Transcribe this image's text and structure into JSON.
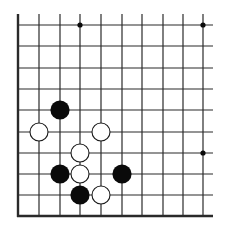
{
  "board": {
    "type": "go-diagram",
    "visible_columns": 10,
    "visible_rows": 10,
    "edges_shown": [
      "left",
      "bottom"
    ],
    "colors": {
      "line": "#2a2a2a",
      "black_stone": "#0a0a0a",
      "white_stone": "#ffffff",
      "white_stone_border": "#1a1a1a",
      "background": "#ffffff"
    },
    "column_x": [
      18,
      39,
      60,
      80,
      101,
      122,
      142,
      163,
      183,
      203
    ],
    "row_y": [
      25,
      46,
      68,
      89,
      110,
      132,
      153,
      174,
      195,
      216
    ],
    "star_points": [
      {
        "col": 3,
        "row": 0
      },
      {
        "col": 9,
        "row": 0
      },
      {
        "col": 9,
        "row": 6
      }
    ],
    "stones": [
      {
        "color": "black",
        "col": 2,
        "row": 4
      },
      {
        "color": "white",
        "col": 1,
        "row": 5
      },
      {
        "color": "white",
        "col": 4,
        "row": 5
      },
      {
        "color": "white",
        "col": 3,
        "row": 6
      },
      {
        "color": "black",
        "col": 2,
        "row": 7
      },
      {
        "color": "white",
        "col": 3,
        "row": 7
      },
      {
        "color": "black",
        "col": 5,
        "row": 7
      },
      {
        "color": "black",
        "col": 3,
        "row": 8
      },
      {
        "color": "white",
        "col": 4,
        "row": 8
      }
    ]
  }
}
